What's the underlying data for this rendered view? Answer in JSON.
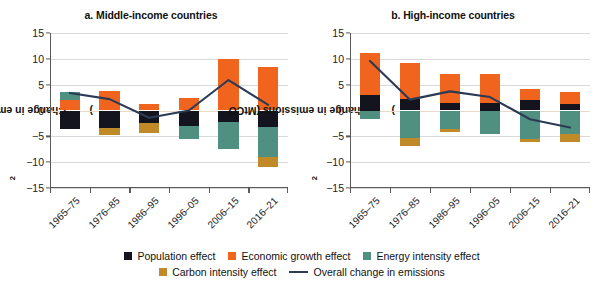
{
  "chart_data": [
    {
      "type": "bar",
      "panel": "a",
      "title": "a. Middle-income countries",
      "xlabel": "",
      "ylabel": "Change in emissions (MtCO2)",
      "ylim": [
        -15,
        15
      ],
      "yticks": [
        15,
        10,
        5,
        0,
        -5,
        -10,
        -15
      ],
      "ytick_labels": [
        "15",
        "10",
        "5",
        "0",
        "−5",
        "−10",
        "−15"
      ],
      "grid": true,
      "legend_position": "bottom",
      "stacked": true,
      "categories": [
        "1965–75",
        "1976–85",
        "1986–95",
        "1996–05",
        "2006–15",
        "2016–21"
      ],
      "series": [
        {
          "name": "Population effect",
          "color": "#14141e",
          "values": [
            -3.5,
            -3.3,
            -2.4,
            -3.0,
            -2.3,
            -3.2
          ]
        },
        {
          "name": "Economic growth effect",
          "color": "#f1641e",
          "values": [
            2.1,
            3.7,
            1.2,
            2.4,
            10.0,
            8.5
          ]
        },
        {
          "name": "Energy intensity effect",
          "color": "#4f9080",
          "values": [
            1.4,
            0.0,
            0.0,
            -2.6,
            -5.1,
            -5.8
          ]
        },
        {
          "name": "Carbon intensity effect",
          "color": "#c08a28",
          "values": [
            0.0,
            -1.4,
            -1.9,
            0.0,
            0.0,
            -1.9
          ]
        }
      ],
      "line": {
        "name": "Overall change in emissions",
        "color": "#2b3a55",
        "values": [
          3.4,
          2.2,
          -1.4,
          0.0,
          5.9,
          1.1
        ]
      }
    },
    {
      "type": "bar",
      "panel": "b",
      "title": "b. High-income countries",
      "xlabel": "",
      "ylabel": "Change in emissions (MtCO2)",
      "ylim": [
        -15,
        15
      ],
      "yticks": [
        15,
        10,
        5,
        0,
        -5,
        -10,
        -15
      ],
      "ytick_labels": [
        "15",
        "10",
        "5",
        "0",
        "−5",
        "−10",
        "−15"
      ],
      "grid": true,
      "legend_position": "bottom",
      "stacked": true,
      "categories": [
        "1965–75",
        "1976–85",
        "1986–95",
        "1996–05",
        "2006–15",
        "2016–21"
      ],
      "series": [
        {
          "name": "Population effect",
          "color": "#14141e",
          "values": [
            3.0,
            2.3,
            1.4,
            1.5,
            2.0,
            1.3
          ]
        },
        {
          "name": "Economic growth effect",
          "color": "#f1641e",
          "values": [
            8.1,
            6.8,
            5.7,
            5.5,
            2.2,
            2.3
          ]
        },
        {
          "name": "Energy intensity effect",
          "color": "#4f9080",
          "values": [
            -1.6,
            -5.3,
            -3.5,
            -4.6,
            -5.6,
            -4.5
          ]
        },
        {
          "name": "Carbon intensity effect",
          "color": "#c08a28",
          "values": [
            0.0,
            -1.6,
            -0.6,
            0.0,
            -0.5,
            -1.6
          ]
        }
      ],
      "line": {
        "name": "Overall change in emissions",
        "color": "#2b3a55",
        "values": [
          9.6,
          2.1,
          3.7,
          2.6,
          -1.7,
          -3.3
        ]
      }
    }
  ],
  "legend": {
    "row1": [
      {
        "label": "Population effect",
        "color": "#14141e",
        "kind": "swatch"
      },
      {
        "label": "Economic growth effect",
        "color": "#f1641e",
        "kind": "swatch"
      },
      {
        "label": "Energy intensity effect",
        "color": "#4f9080",
        "kind": "swatch"
      }
    ],
    "row2": [
      {
        "label": "Carbon intensity effect",
        "color": "#c08a28",
        "kind": "swatch"
      },
      {
        "label": "Overall change in emissions",
        "color": "#2b3a55",
        "kind": "line"
      }
    ]
  },
  "axis_title": {
    "main": "Change in emissions (MtCO",
    "sub": "2",
    "close": ")"
  }
}
